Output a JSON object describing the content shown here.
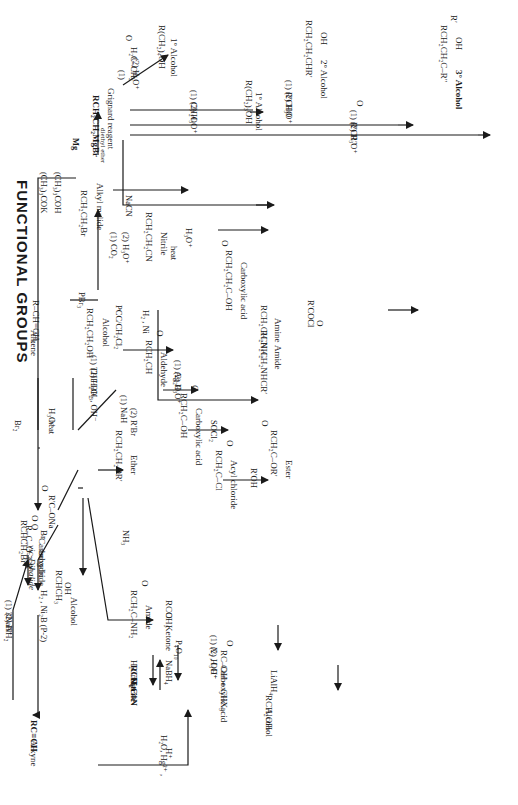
{
  "title": "FUNCTIONAL GROUPS",
  "compounds": {
    "grignard": {
      "formula": "RCH₂CH₂MgBr",
      "name": "Grignard reagent"
    },
    "alkyl_halide": {
      "formula": "RCH₂CH₂Br",
      "name": "Alkyl malide"
    },
    "alcohol_primary": {
      "formula": "RCH₂CH₂OH",
      "name": "Alcohol"
    },
    "alkene": {
      "formula": "R–CH=CH₂",
      "name": "Alkene"
    },
    "alkyne": {
      "formula": "RC≡CH",
      "name": "Alkyne"
    },
    "vic_dihalide": {
      "formula": "RCHCH₂Br",
      "sub": "Br",
      "name": "vic-Dihalide"
    },
    "sec_alcohol": {
      "formula": "RCHCH₃",
      "sub": "OH",
      "name": "Alcohol"
    },
    "ketone": {
      "formula": "RCCH₃",
      "sub": "O",
      "name": "Ketone"
    },
    "haloform_product": {
      "formula": "RC–OH  +  CHX₃",
      "top": "O",
      "name": "Carboxylic acid"
    },
    "lialh4_alcohol": {
      "formula": "RCH₂OH",
      "name": "Alcohol"
    },
    "nitrile_long": {
      "formula": "RCH₂CH₂CN",
      "name": "Nitrile"
    },
    "carboxylic_acid_long": {
      "formula": "RCH₂CH₂C–OH",
      "top": "O",
      "name": "Carboxylic acid"
    },
    "amine": {
      "formula": "RCH₂CH₂NH₂",
      "name": "Amine"
    },
    "amide_sub": {
      "formula": "RCH₂CH₂NHCR′",
      "top": "O",
      "name": "Amide"
    },
    "aldehyde": {
      "formula": "RCH₂CH",
      "top": "O",
      "name": "Aldehyde"
    },
    "carboxylic_acid_short": {
      "formula": "RCH₂C–OH",
      "top": "O",
      "name": "Carboxylic acid"
    },
    "acyl_chloride": {
      "formula": "RCH₂C–Cl",
      "top": "O",
      "name": "Acyl chloride"
    },
    "ester": {
      "formula": "RCH₂C–OR′",
      "top": "O",
      "name": "Ester"
    },
    "ether": {
      "formula": "RCH₂CH₂OR′",
      "name": "Ether"
    },
    "anhydride": {
      "formula": "R–C–O–CR′",
      "top": "O      O",
      "name": "Carboxylic",
      "name2": "anhydride"
    },
    "amide": {
      "formula": "RCH₂C–NH₂",
      "top": "O",
      "name": "Amide"
    },
    "nitrile_short": {
      "formula": "RCH₂C≡N",
      "name": "Nitrile"
    },
    "alcohol_c4": {
      "formula": "R(CH₂)₄OH",
      "name": "1° Alcohol"
    },
    "alcohol_c3": {
      "formula": "R(CH₂)₃OH",
      "name": "1° Alcohol"
    },
    "alcohol_2": {
      "formula": "RCH₂CH₂CHR′",
      "sub": "OH",
      "name": "2° Alcohol"
    },
    "alcohol_3": {
      "formula": "RCH₂CH₂C–R″",
      "top": "R′",
      "sub": "OH",
      "name": "3° Alcohol"
    }
  },
  "reagents": {
    "tbuok_1": "(CH₃)₃COK",
    "tbuok_2": "(CH₃)₃COH",
    "mg_1": "Mg",
    "mg_2": "diethyl ether",
    "pbr3": "PBr₃",
    "nacn": "NaCN",
    "hydrolysis_1": "H₃O⁺",
    "hydrolysis_2": "heat",
    "co2_1": "(1) CO₂",
    "co2_2": "(2) H₃O⁺",
    "h2ni": "H₂ , Ni",
    "rcocl": "R′COCl",
    "pcc": "PCC/CH₂Cl₂",
    "ag2o_1": "(1) Ag₂O",
    "ag2o_2": "(2) H₃O⁺",
    "socl2": "SOCl₂",
    "roh": "R′OH",
    "nh3": "NH₃",
    "rcoona": "R′C–ONa",
    "rcoona_top": "O",
    "p4o10": "P₄O₁₀",
    "nah_1": "(1) NaH",
    "nah_2": "(2) R′Br",
    "hydrob_1": "(1) THF:BH₃",
    "hydrob_2": "(2) H₂O₂ , OH⁻",
    "alkene_h3o_1": "H₃O⁺",
    "alkene_h3o_2": "heat",
    "br2": "Br₂",
    "nanh2_1": "(1) 3NaNH₂",
    "nanh2_2": "(2) H⁺",
    "lindlar": "H₂ , Ni₂B (P-2)",
    "h2cro4": "H₂CrO₄",
    "nabh4": "NaBH₄",
    "hg_1": "H₂O, Hg²⁺ ,",
    "hg_2": "H⁺",
    "haloform_1": "(1) X₂ , OH⁻",
    "haloform_2": "(2) H₃O⁺",
    "lialh4": "LiAlH₄",
    "epoxide_1": "(1)",
    "epoxide_ring": "H₂C–CH₂",
    "epoxide_o": "O",
    "epoxide_2": "(2) H₃O⁺",
    "ch2o_1": "(1) CH₂O",
    "ch2o_2": "(2) H₃O⁺",
    "rcho_1": "(1) R′CHO",
    "rcho_2": "(2) H₃O⁺",
    "ketone_top": "O",
    "ketone_1": "(1) R′CR″",
    "ketone_2": "(2) H₃O⁺"
  },
  "style": {
    "ink": "#1a1a1a",
    "background": "#ffffff"
  }
}
